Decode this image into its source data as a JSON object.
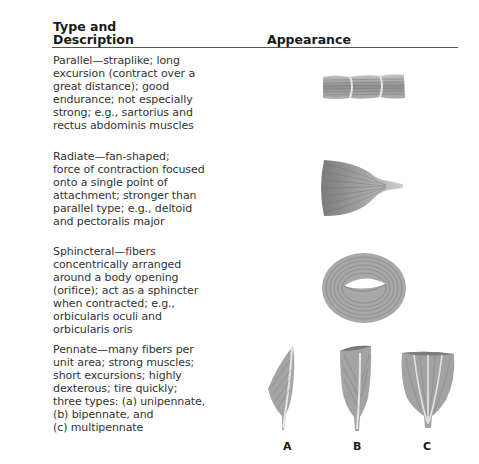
{
  "table": {
    "headers": {
      "type_description": "Type and\nDescription",
      "appearance": "Appearance"
    },
    "rows": [
      {
        "type": "Parallel",
        "description": "Parallel—straplike; long\nexcursion (contract over a\ngreat distance); good\nendurance; not especially\nstrong; e.g., sartorius and\nrectus abdominis muscles",
        "figure": "parallel-muscle-illustration"
      },
      {
        "type": "Radiate",
        "description": "Radiate—fan-shaped;\nforce of contraction focused\nonto a single point of\nattachment; stronger than\nparallel type; e.g., deltoid\nand pectoralis major",
        "figure": "radiate-muscle-illustration"
      },
      {
        "type": "Sphincteral",
        "description": "Sphincteral—fibers\nconcentrically arranged\naround a body opening\n(orifice); act as a sphincter\nwhen contracted; e.g.,\norbicularis oculi and\norbicularis oris",
        "figure": "sphincteral-muscle-illustration"
      },
      {
        "type": "Pennate",
        "description": "Pennate—many fibers per\nunit area; strong muscles;\nshort excursions; highly\ndexterous; tire quickly;\nthree types: (a) unipennate,\n(b) bipennate, and\n(c) multipennate",
        "figure": "pennate-muscle-illustrations",
        "sub_labels": [
          "A",
          "B",
          "C"
        ]
      }
    ]
  },
  "colors": {
    "text": "#333333",
    "rule": "#555555",
    "muscle": "#9a9a9a"
  }
}
